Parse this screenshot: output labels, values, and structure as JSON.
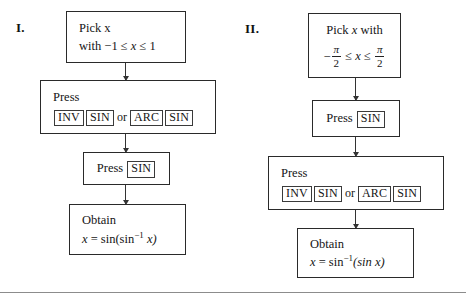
{
  "figure": {
    "background": "#ffffff",
    "line_color": "#2a2a2a",
    "columns": [
      {
        "label": "I.",
        "steps": [
          {
            "name": "pick-x",
            "line1": "Pick x",
            "line2_prefix": "with −1 ≤ ",
            "line2_var": "x",
            "line2_suffix": " ≤ 1"
          },
          {
            "name": "press-inv-sin-or-arc-sin",
            "line1": "Press",
            "keys": [
              "INV",
              "SIN",
              "ARC",
              "SIN"
            ],
            "or_word": "or"
          },
          {
            "name": "press-sin",
            "line1": "Press",
            "keys": [
              "SIN"
            ]
          },
          {
            "name": "obtain-result",
            "line1": "Obtain",
            "result_var": "x",
            "result_eq": " = sin(sin",
            "result_sup": "−1",
            "result_inner": " x)"
          }
        ]
      },
      {
        "label": "II.",
        "steps": [
          {
            "name": "pick-x-with-range",
            "line1_prefix": "Pick ",
            "line1_var": "x",
            "line1_suffix": " with",
            "range_minus": "−",
            "range_num1": "π",
            "range_den1": "2",
            "range_mid": " ≤ ",
            "range_var": "x",
            "range_mid2": " ≤ ",
            "range_num2": "π",
            "range_den2": "2"
          },
          {
            "name": "press-sin",
            "line1": "Press",
            "keys": [
              "SIN"
            ]
          },
          {
            "name": "press-inv-sin-or-arc-sin",
            "line1": "Press",
            "keys": [
              "INV",
              "SIN",
              "ARC",
              "SIN"
            ],
            "or_word": "or"
          },
          {
            "name": "obtain-result",
            "line1": "Obtain",
            "result_var": "x",
            "result_eq": " = sin",
            "result_sup": "−1",
            "result_inner": "(sin x)"
          }
        ]
      }
    ]
  }
}
